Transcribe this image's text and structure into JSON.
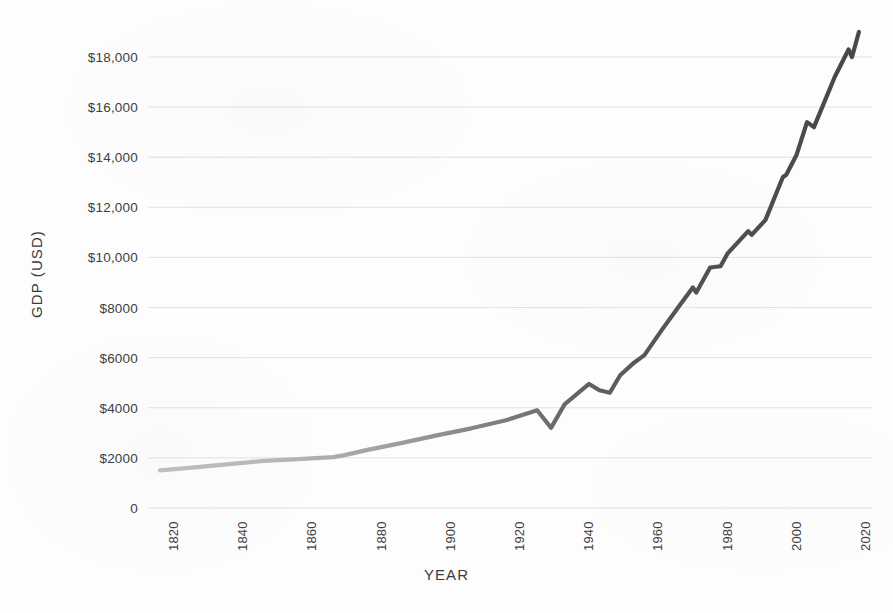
{
  "chart_data": {
    "type": "line",
    "title": "",
    "xlabel": "YEAR",
    "ylabel": "GDP (USD)",
    "xlim": [
      1820,
      2022
    ],
    "ylim": [
      0,
      19000
    ],
    "grid": true,
    "legend": null,
    "series_name": "GDP (USD)",
    "line_color_early": "#b4b4b4",
    "line_color_late": "#4a4a4a",
    "x_tick_labels": [
      "1820",
      "1840",
      "1860",
      "1880",
      "1900",
      "1920",
      "1940",
      "1960",
      "1980",
      "2000",
      "2020"
    ],
    "x_ticks": [
      1820,
      1840,
      1860,
      1880,
      1900,
      1920,
      1940,
      1960,
      1980,
      2000,
      2020
    ],
    "y_tick_labels": [
      "0",
      "$2000",
      "$4000",
      "$6000",
      "$8000",
      "$10,000",
      "$12,000",
      "$14,000",
      "$16,000",
      "$18,000"
    ],
    "y_ticks": [
      0,
      2000,
      4000,
      6000,
      8000,
      10000,
      12000,
      14000,
      16000,
      18000
    ],
    "x": [
      1820,
      1830,
      1840,
      1850,
      1860,
      1870,
      1873,
      1880,
      1890,
      1900,
      1910,
      1920,
      1929,
      1933,
      1937,
      1944,
      1947,
      1950,
      1953,
      1957,
      1960,
      1965,
      1970,
      1974,
      1975,
      1979,
      1982,
      1984,
      1990,
      1991,
      1995,
      2000,
      2001,
      2004,
      2007,
      2009,
      2012,
      2015,
      2019,
      2020,
      2022
    ],
    "values": [
      1500,
      1620,
      1750,
      1880,
      1950,
      2030,
      2100,
      2320,
      2600,
      2900,
      3180,
      3500,
      3900,
      3200,
      4150,
      4950,
      4700,
      4600,
      5300,
      5800,
      6100,
      7100,
      8050,
      8800,
      8600,
      9600,
      9650,
      10150,
      11050,
      10900,
      11500,
      13200,
      13300,
      14100,
      15400,
      15200,
      16200,
      17200,
      18300,
      18000,
      19000
    ]
  }
}
